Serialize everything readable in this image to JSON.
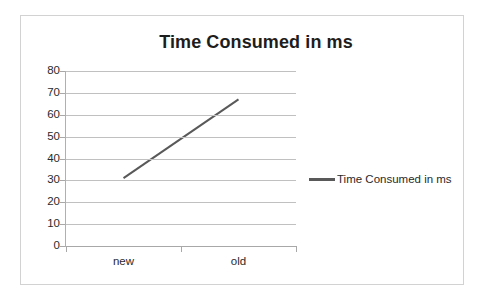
{
  "chart_data": {
    "type": "line",
    "title": "Time Consumed in ms",
    "xlabel": "",
    "ylabel": "",
    "categories": [
      "new",
      "old"
    ],
    "series": [
      {
        "name": "Time Consumed in ms",
        "values": [
          31,
          67
        ],
        "color": "#595959"
      }
    ],
    "ylim": [
      0,
      80
    ],
    "yticks": [
      0,
      10,
      20,
      30,
      40,
      50,
      60,
      70,
      80
    ],
    "ytick_labels": [
      "0",
      "10",
      "20",
      "30",
      "40",
      "50",
      "60",
      "70",
      "80"
    ],
    "grid": true,
    "legend_position": "right"
  },
  "legend": {
    "entries": [
      {
        "label": "Time Consumed in ms",
        "color": "#595959"
      }
    ]
  },
  "colors": {
    "series": "#595959",
    "gridline": "#c0c0c0",
    "axis": "#a8a8a8",
    "text": "#2a2a2a",
    "frame": "#d2d2d2",
    "background": "#ffffff"
  }
}
